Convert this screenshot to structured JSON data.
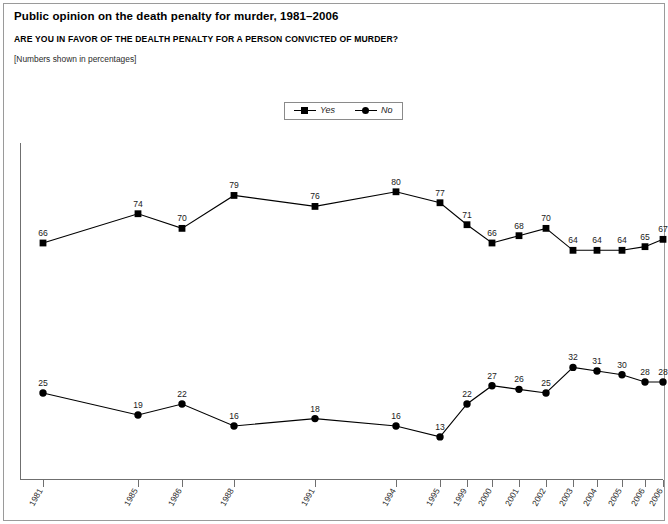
{
  "header": {
    "title": "Public opinion on the death penalty for murder, 1981–2006",
    "question": "ARE YOU IN FAVOR OF THE DEALTH PENALTY FOR A PERSON CONVICTED OF MURDER?",
    "note": "[Numbers shown in percentages]"
  },
  "legend": {
    "position": "top-center",
    "items": [
      {
        "label": "Yes",
        "marker": "square",
        "color": "#000000"
      },
      {
        "label": "No",
        "marker": "circle",
        "color": "#000000"
      }
    ]
  },
  "chart_data": {
    "type": "line",
    "title": "Public opinion on the death penalty for murder, 1981–2006",
    "subtitle": "ARE YOU IN FAVOR OF THE DEALTH PENALTY FOR A PERSON CONVICTED OF MURDER?",
    "annotation": "[Numbers shown in percentages]",
    "xlabel": "",
    "ylabel": "",
    "ylim": [
      0,
      100
    ],
    "grid": false,
    "legend_position": "top-center",
    "categories": [
      "1981",
      "1985",
      "1986",
      "1988",
      "1991",
      "1994",
      "1995",
      "1999",
      "2000",
      "2001",
      "2002",
      "2003",
      "2004",
      "2005",
      "2006",
      "2006"
    ],
    "x_positions": [
      43,
      138,
      182,
      234,
      315,
      396,
      440,
      467,
      492,
      519,
      546,
      573,
      597,
      622,
      645,
      663
    ],
    "series": [
      {
        "name": "Yes",
        "marker": "square",
        "color": "#000000",
        "values": [
          66,
          74,
          70,
          79,
          76,
          80,
          77,
          71,
          66,
          68,
          70,
          64,
          64,
          64,
          65,
          67
        ]
      },
      {
        "name": "No",
        "marker": "circle",
        "color": "#000000",
        "values": [
          25,
          19,
          22,
          16,
          18,
          16,
          13,
          22,
          27,
          26,
          25,
          32,
          31,
          30,
          28,
          28
        ]
      }
    ]
  },
  "style": {
    "axis_color": "#6f6f6f",
    "line_color": "#000000",
    "frame_color": "#9a9a9a",
    "text_color": "#000000"
  }
}
